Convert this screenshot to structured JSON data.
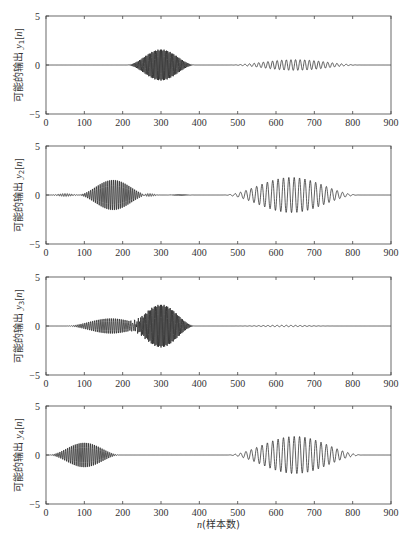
{
  "figure": {
    "xlabel": "n(样本数)",
    "xlabel_var": "n",
    "xlabel_text": "(样本数)"
  },
  "chart_data": [
    {
      "type": "line",
      "title": "",
      "ylabel": "可能的输出 y1[n]",
      "ylabel_prefix": "可能的输出 ",
      "ylabel_var": "y",
      "ylabel_sub": "1",
      "ylabel_suffix": "[n]",
      "xlim": [
        0,
        900
      ],
      "ylim": [
        -5,
        5
      ],
      "xticks": [
        0,
        100,
        200,
        300,
        400,
        500,
        600,
        700,
        800,
        900
      ],
      "yticks": [
        -5,
        0,
        5
      ],
      "grid": false,
      "packets": [
        {
          "center": 300,
          "halfwidth": 90,
          "amplitude": 1.6,
          "period": 3.2
        },
        {
          "center": 650,
          "halfwidth": 175,
          "amplitude": 0.55,
          "period": 12
        }
      ]
    },
    {
      "type": "line",
      "title": "",
      "ylabel": "可能的输出 y2[n]",
      "ylabel_prefix": "可能的输出 ",
      "ylabel_var": "y",
      "ylabel_sub": "2",
      "ylabel_suffix": "[n]",
      "xlim": [
        0,
        900
      ],
      "ylim": [
        -5,
        5
      ],
      "xticks": [
        0,
        100,
        200,
        300,
        400,
        500,
        600,
        700,
        800,
        900
      ],
      "yticks": [
        -5,
        0,
        5
      ],
      "grid": false,
      "packets": [
        {
          "center": 175,
          "halfwidth": 95,
          "amplitude": 1.6,
          "period": 5
        },
        {
          "center": 50,
          "halfwidth": 40,
          "amplitude": 0.15,
          "period": 6
        },
        {
          "center": 270,
          "halfwidth": 30,
          "amplitude": 0.15,
          "period": 6
        },
        {
          "center": 350,
          "halfwidth": 40,
          "amplitude": 0.06,
          "period": 3
        },
        {
          "center": 640,
          "halfwidth": 180,
          "amplitude": 1.8,
          "period": 14
        }
      ]
    },
    {
      "type": "line",
      "title": "",
      "ylabel": "可能的输出 y3[n]",
      "ylabel_prefix": "可能的输出 ",
      "ylabel_var": "y",
      "ylabel_sub": "3",
      "ylabel_suffix": "[n]",
      "xlim": [
        0,
        900
      ],
      "ylim": [
        -5,
        5
      ],
      "xticks": [
        0,
        100,
        200,
        300,
        400,
        500,
        600,
        700,
        800,
        900
      ],
      "yticks": [
        -5,
        0,
        5
      ],
      "grid": false,
      "packets": [
        {
          "center": 170,
          "halfwidth": 120,
          "amplitude": 0.8,
          "period": 5
        },
        {
          "center": 300,
          "halfwidth": 90,
          "amplitude": 2.2,
          "period": 3.2
        },
        {
          "center": 620,
          "halfwidth": 140,
          "amplitude": 0.07,
          "period": 12
        }
      ]
    },
    {
      "type": "line",
      "title": "",
      "ylabel": "可能的输出 y4[n]",
      "ylabel_prefix": "可能的输出 ",
      "ylabel_var": "y",
      "ylabel_sub": "4",
      "ylabel_suffix": "[n]",
      "xlim": [
        0,
        900
      ],
      "ylim": [
        -5,
        5
      ],
      "xticks": [
        0,
        100,
        200,
        300,
        400,
        500,
        600,
        700,
        800,
        900
      ],
      "yticks": [
        -5,
        0,
        5
      ],
      "grid": false,
      "packets": [
        {
          "center": 100,
          "halfwidth": 95,
          "amplitude": 1.3,
          "period": 5
        },
        {
          "center": 650,
          "halfwidth": 180,
          "amplitude": 1.9,
          "period": 14
        }
      ]
    }
  ],
  "layout": {
    "axes_left": 46,
    "axes_right": 391,
    "axes_tops": [
      16,
      146,
      277,
      406
    ],
    "axes_height": 98,
    "line_color": "#1a1a1a",
    "axis_color": "#444444"
  }
}
